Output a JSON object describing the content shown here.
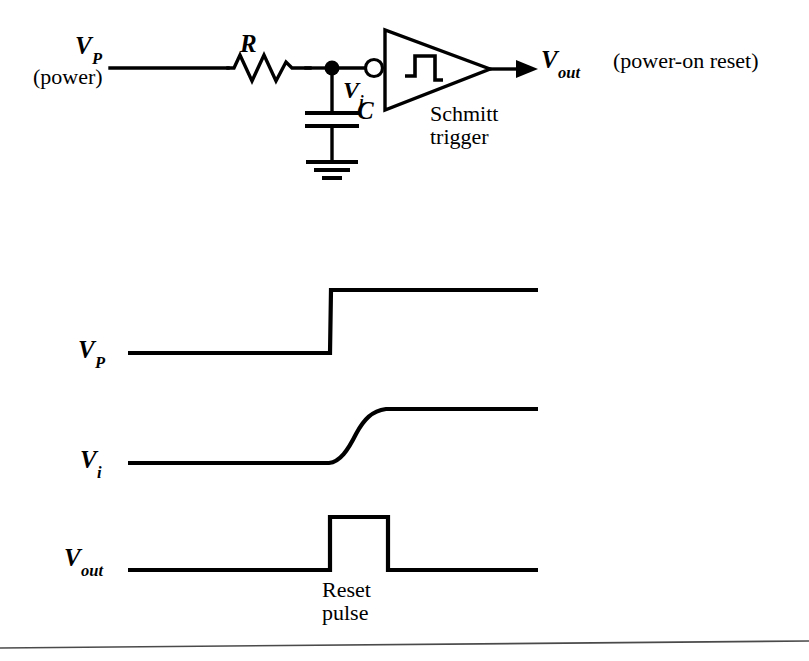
{
  "figure": {
    "ink_color": "#000000",
    "background_color": "#ffffff"
  },
  "circuit": {
    "source_label": "V",
    "source_sub": "P",
    "source_note": "(power)",
    "resistor_label": "R",
    "node_label": "V",
    "node_sub": "i",
    "capacitor_label": "C",
    "gate_name_line1": "Schmitt",
    "gate_name_line2": "trigger",
    "gate_symbol": "hysteresis-glyph",
    "gate_inverting": true,
    "output_label": "V",
    "output_sub": "out",
    "output_note": "(power-on reset)",
    "ground_symbol": "earth-ground"
  },
  "waveforms": {
    "vp": {
      "label": "V",
      "sub": "P",
      "shape": "step",
      "baseline_y": 353,
      "top_y": 290,
      "edge_x": 330,
      "start_x": 128,
      "end_x": 538
    },
    "vi": {
      "label": "V",
      "sub": "i",
      "shape": "rc-exponential-rise",
      "baseline_y": 463,
      "top_y": 409,
      "rise_start_x": 330,
      "rise_end_x": 398,
      "start_x": 128,
      "end_x": 538
    },
    "vout": {
      "label": "V",
      "sub": "out",
      "shape": "pulse",
      "baseline_y": 570,
      "top_y": 517,
      "rise_x": 330,
      "fall_x": 388,
      "start_x": 128,
      "end_x": 538,
      "annotation_line1": "Reset",
      "annotation_line2": "pulse"
    }
  },
  "footer": {
    "rule": "horizontal-rule"
  }
}
